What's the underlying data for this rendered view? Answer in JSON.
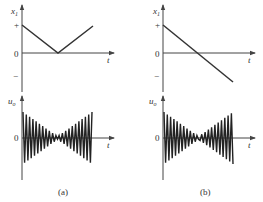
{
  "figure": {
    "panels": [
      {
        "id": "a",
        "caption": "(a)",
        "top_plot": {
          "y_label_main": "x",
          "y_label_sub": "1",
          "x_label": "t",
          "ticks": {
            "plus": "+",
            "zero": "0",
            "minus": "−"
          },
          "description": "V-shaped |x1|: starts at +, decreases linearly to 0, then increases back toward +"
        },
        "bottom_plot": {
          "y_label_main": "u",
          "y_label_sub": "o",
          "x_label": "t",
          "zero": "0",
          "description": "Oscillation with amplitude decaying to near zero at mid then growing again"
        }
      },
      {
        "id": "b",
        "caption": "(b)",
        "top_plot": {
          "y_label_main": "x",
          "y_label_sub": "1",
          "x_label": "t",
          "ticks": {
            "plus": "+",
            "zero": "0",
            "minus": "−"
          },
          "description": "Linear ramp from + through 0 to −"
        },
        "bottom_plot": {
          "y_label_main": "u",
          "y_label_sub": "o",
          "x_label": "t",
          "zero": "0",
          "description": "Oscillation with amplitude decaying to near zero at mid then growing again (phase reversal)"
        }
      }
    ],
    "colors": {
      "line": "#333333",
      "axis": "#444444",
      "background": "#ffffff"
    }
  }
}
